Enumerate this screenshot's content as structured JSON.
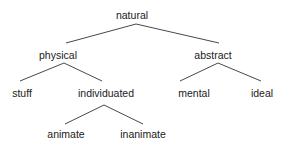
{
  "diagram": {
    "type": "tree",
    "line_color": "#333333",
    "text_color": "#1a1a1a",
    "nodes": [
      {
        "id": "natural",
        "label": "natural",
        "x": 132,
        "y": 15
      },
      {
        "id": "physical",
        "label": "physical",
        "x": 58,
        "y": 55
      },
      {
        "id": "abstract",
        "label": "abstract",
        "x": 213,
        "y": 55
      },
      {
        "id": "stuff",
        "label": "stuff",
        "x": 22,
        "y": 93
      },
      {
        "id": "individuated",
        "label": "individuated",
        "x": 106,
        "y": 93
      },
      {
        "id": "mental",
        "label": "mental",
        "x": 194,
        "y": 93
      },
      {
        "id": "ideal",
        "label": "ideal",
        "x": 262,
        "y": 93
      },
      {
        "id": "animate",
        "label": "animate",
        "x": 66,
        "y": 134
      },
      {
        "id": "inanimate",
        "label": "inanimate",
        "x": 143,
        "y": 134
      }
    ],
    "edges": [
      {
        "from": "natural",
        "to": "physical",
        "x1": 136,
        "y1": 24,
        "x2": 66,
        "y2": 43
      },
      {
        "from": "natural",
        "to": "abstract",
        "x1": 136,
        "y1": 24,
        "x2": 219,
        "y2": 43
      },
      {
        "from": "physical",
        "to": "stuff",
        "x1": 64,
        "y1": 63,
        "x2": 20,
        "y2": 81
      },
      {
        "from": "physical",
        "to": "individuated",
        "x1": 64,
        "y1": 63,
        "x2": 102,
        "y2": 81
      },
      {
        "from": "abstract",
        "to": "mental",
        "x1": 218,
        "y1": 63,
        "x2": 180,
        "y2": 81
      },
      {
        "from": "abstract",
        "to": "ideal",
        "x1": 218,
        "y1": 63,
        "x2": 261,
        "y2": 81
      },
      {
        "from": "individuated",
        "to": "animate",
        "x1": 104,
        "y1": 105,
        "x2": 65,
        "y2": 124
      },
      {
        "from": "individuated",
        "to": "inanimate",
        "x1": 104,
        "y1": 105,
        "x2": 143,
        "y2": 124
      }
    ]
  }
}
